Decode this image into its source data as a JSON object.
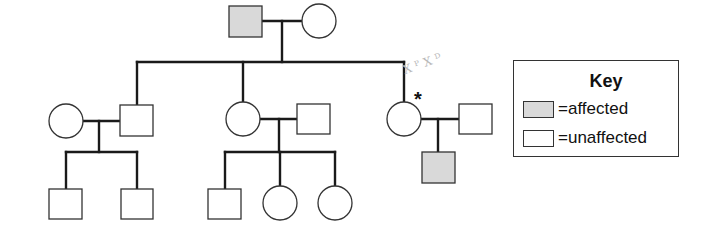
{
  "colors": {
    "affected_fill": "#d9d9d9",
    "unaffected_fill": "#ffffff",
    "line": "#1a1a1a"
  },
  "pedigree": {
    "generation_1": [
      {
        "id": "I-1",
        "sex": "male",
        "status": "affected"
      },
      {
        "id": "I-2",
        "sex": "female",
        "status": "unaffected"
      }
    ],
    "generation_2": [
      {
        "id": "II-1",
        "sex": "female",
        "status": "unaffected",
        "note": "married-in"
      },
      {
        "id": "II-2",
        "sex": "male",
        "status": "unaffected"
      },
      {
        "id": "II-3",
        "sex": "female",
        "status": "unaffected"
      },
      {
        "id": "II-4",
        "sex": "male",
        "status": "unaffected",
        "note": "married-in"
      },
      {
        "id": "II-5",
        "sex": "female",
        "status": "unaffected",
        "marker": "*"
      },
      {
        "id": "II-6",
        "sex": "male",
        "status": "unaffected",
        "note": "married-in"
      }
    ],
    "generation_3": [
      {
        "id": "III-1",
        "sex": "male",
        "status": "unaffected"
      },
      {
        "id": "III-2",
        "sex": "male",
        "status": "unaffected"
      },
      {
        "id": "III-3",
        "sex": "male",
        "status": "unaffected"
      },
      {
        "id": "III-4",
        "sex": "female",
        "status": "unaffected"
      },
      {
        "id": "III-5",
        "sex": "female",
        "status": "unaffected"
      },
      {
        "id": "III-6",
        "sex": "male",
        "status": "affected"
      }
    ]
  },
  "marker": "*",
  "handwritten_annotation": "XᴾXᴰ",
  "key": {
    "title": "Key",
    "items": [
      {
        "label": "=affected",
        "fill": "#d9d9d9"
      },
      {
        "label": "=unaffected",
        "fill": "#ffffff"
      }
    ]
  }
}
